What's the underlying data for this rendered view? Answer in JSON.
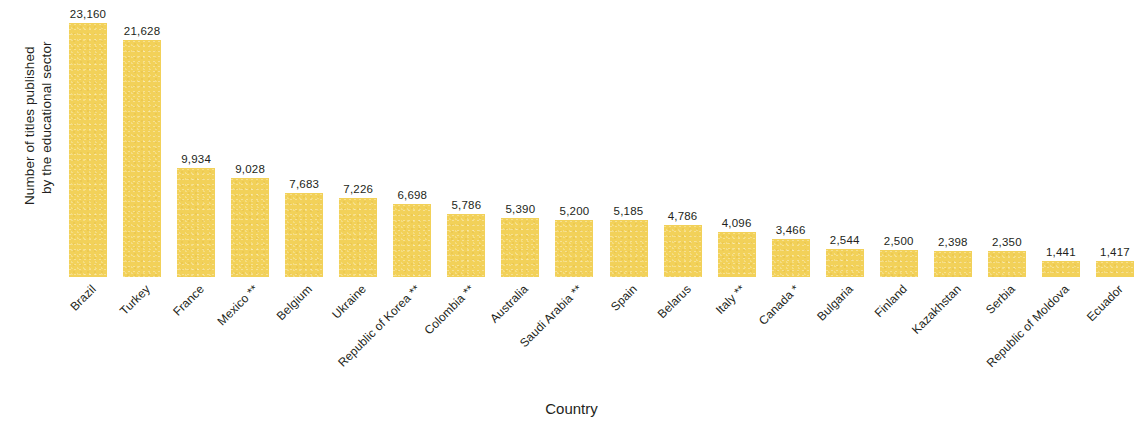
{
  "chart_data": {
    "type": "bar",
    "title": "",
    "subtitle": "",
    "xlabel": "Country",
    "ylabel": "Number of titles published by the educational sector",
    "ylabel_line1": "Number of titles published",
    "ylabel_line2": "by the educational sector",
    "categories": [
      "Brazil",
      "Turkey",
      "France",
      "Mexico **",
      "Belgium",
      "Ukraine",
      "Republic of Korea **",
      "Colombia **",
      "Australia",
      "Saudi Arabia **",
      "Spain",
      "Belarus",
      "Italy **",
      "Canada *",
      "Bulgaria",
      "Finland",
      "Kazakhstan",
      "Serbia",
      "Republic of Moldova",
      "Ecuador"
    ],
    "values": [
      23160,
      21628,
      9934,
      9028,
      7683,
      7226,
      6698,
      5786,
      5390,
      5200,
      5185,
      4786,
      4096,
      3466,
      2544,
      2500,
      2398,
      2350,
      1441,
      1417
    ],
    "value_labels": [
      "23,160",
      "21,628",
      "9,934",
      "9,028",
      "7,683",
      "7,226",
      "6,698",
      "5,786",
      "5,390",
      "5,200",
      "5,185",
      "4,786",
      "4,096",
      "3,466",
      "2,544",
      "2,500",
      "2,398",
      "2,350",
      "1,441",
      "1,417"
    ],
    "ylim": [
      0,
      23160
    ],
    "grid": false,
    "axis_lines": false,
    "legend": "none",
    "bar_color": "#f2d159",
    "text_color": "#231f20",
    "background_color": "#ffffff"
  }
}
